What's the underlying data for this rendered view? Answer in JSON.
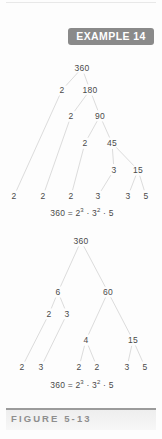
{
  "badge": {
    "label": "EXAMPLE 14"
  },
  "caption": {
    "label": "FIGURE 5-13"
  },
  "figure": {
    "tree1": {
      "name": "cascading-factor-tree",
      "nodes": [
        {
          "id": "t1-root",
          "value": "360",
          "x": 82,
          "y": 68
        },
        {
          "id": "t1-n1",
          "value": "2",
          "x": 62,
          "y": 90
        },
        {
          "id": "t1-n2",
          "value": "180",
          "x": 90,
          "y": 90
        },
        {
          "id": "t1-n3",
          "value": "2",
          "x": 71,
          "y": 116
        },
        {
          "id": "t1-n4",
          "value": "90",
          "x": 100,
          "y": 116
        },
        {
          "id": "t1-n5",
          "value": "2",
          "x": 85,
          "y": 143
        },
        {
          "id": "t1-n6",
          "value": "45",
          "x": 112,
          "y": 143
        },
        {
          "id": "t1-n7",
          "value": "3",
          "x": 114,
          "y": 170
        },
        {
          "id": "t1-n8",
          "value": "15",
          "x": 138,
          "y": 170
        },
        {
          "id": "t1-l1",
          "value": "2",
          "x": 14,
          "y": 196
        },
        {
          "id": "t1-l2",
          "value": "2",
          "x": 43,
          "y": 196
        },
        {
          "id": "t1-l3",
          "value": "2",
          "x": 71,
          "y": 196
        },
        {
          "id": "t1-l4",
          "value": "3",
          "x": 98,
          "y": 196
        },
        {
          "id": "t1-l5",
          "value": "3",
          "x": 128,
          "y": 196
        },
        {
          "id": "t1-l6",
          "value": "5",
          "x": 146,
          "y": 196
        }
      ],
      "equation": {
        "base": "360 = 2",
        "exp1": "3",
        "mid": " · 3",
        "exp2": "2",
        "tail": " · 5",
        "x": 82,
        "y": 208
      }
    },
    "tree2": {
      "name": "balanced-factor-tree",
      "nodes": [
        {
          "id": "t2-root",
          "value": "360",
          "x": 81,
          "y": 241
        },
        {
          "id": "t2-n1",
          "value": "6",
          "x": 58,
          "y": 292
        },
        {
          "id": "t2-n2",
          "value": "60",
          "x": 108,
          "y": 292
        },
        {
          "id": "t2-n3",
          "value": "2",
          "x": 49,
          "y": 314
        },
        {
          "id": "t2-n4",
          "value": "3",
          "x": 67,
          "y": 314
        },
        {
          "id": "t2-n5",
          "value": "4",
          "x": 86,
          "y": 340
        },
        {
          "id": "t2-n6",
          "value": "15",
          "x": 133,
          "y": 340
        },
        {
          "id": "t2-l1",
          "value": "2",
          "x": 22,
          "y": 367
        },
        {
          "id": "t2-l2",
          "value": "3",
          "x": 41,
          "y": 367
        },
        {
          "id": "t2-l3",
          "value": "2",
          "x": 79,
          "y": 367
        },
        {
          "id": "t2-l4",
          "value": "2",
          "x": 97,
          "y": 367
        },
        {
          "id": "t2-l5",
          "value": "3",
          "x": 127,
          "y": 367
        },
        {
          "id": "t2-l6",
          "value": "5",
          "x": 145,
          "y": 367
        }
      ],
      "equation": {
        "base": "360 = 2",
        "exp1": "3",
        "mid": " · 3",
        "exp2": "2",
        "tail": " · 5",
        "x": 82,
        "y": 380
      }
    },
    "line_color": "#dcdcdc",
    "text_color": "#4a4a4a"
  }
}
